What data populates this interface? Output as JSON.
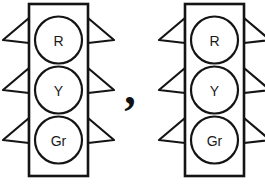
{
  "figure": {
    "background_color": "#ffffff",
    "ink_color": "#141414",
    "width": 265,
    "height": 187
  },
  "separator": {
    "glyph": ",",
    "name": "comma"
  },
  "signals": [
    {
      "id": "left-traffic-light",
      "housing": {
        "x": 29,
        "y": 4,
        "width": 59,
        "height": 172
      },
      "lamps": [
        {
          "id": "red",
          "label": "R",
          "cx": 58.5,
          "cy": 40,
          "r": 23.5,
          "visor_y": 30
        },
        {
          "id": "yellow",
          "label": "Y",
          "cx": 58.5,
          "cy": 90,
          "r": 23.5,
          "visor_y": 80
        },
        {
          "id": "green",
          "label": "Gr",
          "cx": 58.5,
          "cy": 140,
          "r": 23.5,
          "visor_y": 130
        }
      ]
    },
    {
      "id": "right-traffic-light",
      "housing": {
        "x": 185,
        "y": 4,
        "width": 59,
        "height": 172
      },
      "lamps": [
        {
          "id": "red",
          "label": "R",
          "cx": 214.5,
          "cy": 40,
          "r": 23.5,
          "visor_y": 30
        },
        {
          "id": "yellow",
          "label": "Y",
          "cx": 214.5,
          "cy": 90,
          "r": 23.5,
          "visor_y": 80
        },
        {
          "id": "green",
          "label": "Gr",
          "cx": 214.5,
          "cy": 140,
          "r": 23.5,
          "visor_y": 130
        }
      ]
    }
  ],
  "separator_position": {
    "x": 130,
    "y": 104
  }
}
